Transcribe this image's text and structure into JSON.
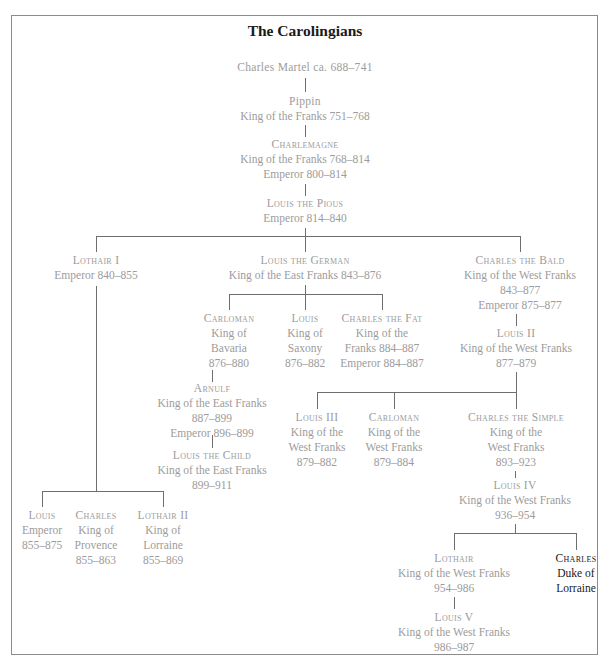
{
  "title": "The Carolingians",
  "nodes": {
    "charles_martel": {
      "name": "Charles Martel ca. 688–741",
      "lines": []
    },
    "pippin": {
      "name": "Pippin",
      "lines": [
        "King of the Franks 751–768"
      ]
    },
    "charlemagne": {
      "name": "Charlemagne",
      "lines": [
        "King of the Franks 768–814",
        "Emperor 800–814"
      ]
    },
    "louis_pious": {
      "name": "Louis the Pious",
      "lines": [
        "Emperor 814–840"
      ]
    },
    "lothair_i": {
      "name": "Lothair I",
      "lines": [
        "Emperor 840–855"
      ]
    },
    "louis_german": {
      "name": "Louis the German",
      "lines": [
        "King of the East Franks 843–876"
      ]
    },
    "charles_bald": {
      "name": "Charles the Bald",
      "lines": [
        "King of the West Franks",
        "843–877",
        "Emperor 875–877"
      ]
    },
    "carloman_bav": {
      "name": "Carloman",
      "lines": [
        "King of",
        "Bavaria",
        "876–880"
      ]
    },
    "louis_saxony": {
      "name": "Louis",
      "lines": [
        "King of",
        "Saxony",
        "876–882"
      ]
    },
    "charles_fat": {
      "name": "Charles the Fat",
      "lines": [
        "King of the",
        "Franks 884–887",
        "Emperor 884–887"
      ]
    },
    "louis_ii_wf": {
      "name": "Louis II",
      "lines": [
        "King of the West Franks",
        "877–879"
      ]
    },
    "arnulf": {
      "name": "Arnulf",
      "lines": [
        "King of the East Franks",
        "887–899",
        "Emperor 896–899"
      ]
    },
    "louis_child": {
      "name": "Louis the Child",
      "lines": [
        "King of the East Franks",
        "899–911"
      ]
    },
    "louis_iii": {
      "name": "Louis III",
      "lines": [
        "King of the",
        "West Franks",
        "879–882"
      ]
    },
    "carloman_wf": {
      "name": "Carloman",
      "lines": [
        "King of the",
        "West Franks",
        "879–884"
      ]
    },
    "charles_simple": {
      "name": "Charles the Simple",
      "lines": [
        "King of the",
        "West Franks",
        "893–923"
      ]
    },
    "louis_iv": {
      "name": "Louis IV",
      "lines": [
        "King of the West Franks",
        "936–954"
      ]
    },
    "louis_emp": {
      "name": "Louis",
      "lines": [
        "Emperor",
        "855–875"
      ]
    },
    "charles_prov": {
      "name": "Charles",
      "lines": [
        "King of",
        "Provence",
        "855–863"
      ]
    },
    "lothair_ii": {
      "name": "Lothair II",
      "lines": [
        "King of",
        "Lorraine",
        "855–869"
      ]
    },
    "lothair_wf": {
      "name": "Lothair",
      "lines": [
        "King of the West Franks",
        "954–986"
      ]
    },
    "charles_lorraine": {
      "name": "Charles",
      "lines": [
        "Duke of",
        "Lorraine"
      ]
    },
    "louis_v": {
      "name": "Louis V",
      "lines": [
        "King of the West Franks",
        "986–987"
      ]
    }
  },
  "colors": {
    "text_muted": "#9c9c9c",
    "text_dark": "#1a1a1a",
    "line": "#6e6e6e",
    "frame": "#8c8c8c"
  }
}
